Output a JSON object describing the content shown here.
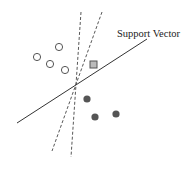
{
  "diagram": {
    "label": "Support Vector",
    "colors": {
      "line": "#333333",
      "open_point_fill": "#ffffff",
      "open_point_stroke": "#555555",
      "filled_point": "#555555",
      "square_fill": "#bbbbbb",
      "square_stroke": "#555555"
    },
    "hyperplane": {
      "x1": 17,
      "y1": 123,
      "x2": 147,
      "y2": 39
    },
    "dashed_lines": [
      {
        "x1": 81,
        "y1": 12,
        "x2": 71,
        "y2": 157
      },
      {
        "x1": 102,
        "y1": 12,
        "x2": 52,
        "y2": 151
      }
    ],
    "open_points": [
      {
        "cx": 59,
        "cy": 47
      },
      {
        "cx": 37,
        "cy": 57
      },
      {
        "cx": 50,
        "cy": 64
      },
      {
        "cx": 65,
        "cy": 70
      }
    ],
    "filled_points": [
      {
        "cx": 87,
        "cy": 99
      },
      {
        "cx": 95,
        "cy": 117
      },
      {
        "cx": 116,
        "cy": 114
      }
    ],
    "square_point": {
      "x": 90,
      "y": 61,
      "size": 7
    }
  }
}
